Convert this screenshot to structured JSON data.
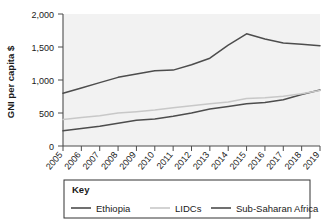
{
  "chart_data": {
    "type": "line",
    "title": "",
    "xlabel": "",
    "ylabel": "GNI per capita $",
    "x": [
      "2005",
      "2006",
      "2007",
      "2008",
      "2009",
      "2010",
      "2011",
      "2012",
      "2013",
      "2014",
      "2015",
      "2016",
      "2017",
      "2018",
      "2019"
    ],
    "ylim": [
      0,
      2000
    ],
    "yticks": [
      0,
      500,
      1000,
      1500,
      2000
    ],
    "ytick_labels": [
      "0",
      "500",
      "1,000",
      "1,500",
      "2,000"
    ],
    "grid": false,
    "legend_position": "bottom",
    "legend_title": "Key",
    "series": [
      {
        "name": "Ethiopia",
        "color": "#4d4d4d",
        "values": [
          230,
          265,
          300,
          345,
          390,
          410,
          450,
          500,
          560,
          600,
          640,
          660,
          700,
          780,
          850
        ]
      },
      {
        "name": "LIDCs",
        "color": "#c8c8c8",
        "values": [
          400,
          430,
          460,
          500,
          520,
          545,
          580,
          610,
          640,
          665,
          720,
          730,
          755,
          790,
          840
        ]
      },
      {
        "name": "Sub-Saharan Africa",
        "color": "#4d4d4d",
        "values": [
          800,
          880,
          960,
          1040,
          1090,
          1140,
          1150,
          1230,
          1330,
          1530,
          1700,
          1620,
          1560,
          1540,
          1520
        ]
      }
    ]
  },
  "axes": {
    "y_axis_title": "GNI per capita $"
  }
}
